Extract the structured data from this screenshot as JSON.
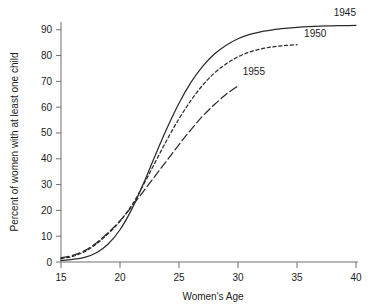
{
  "chart_data": {
    "type": "line",
    "title": "",
    "xlabel": "Women's Age",
    "ylabel": "Percent of women with at least one child",
    "xlim": [
      15,
      40
    ],
    "ylim": [
      0,
      93
    ],
    "grid": false,
    "legend_position": "inline-end-of-line",
    "xticks": [
      15,
      20,
      25,
      30,
      35,
      40
    ],
    "xtick_labels": [
      "15",
      "20",
      "25",
      "30",
      "35",
      "40"
    ],
    "yticks": [
      0,
      10,
      20,
      30,
      40,
      50,
      60,
      70,
      80,
      90
    ],
    "ytick_labels": [
      "0",
      "10",
      "20",
      "30",
      "40",
      "50",
      "60",
      "70",
      "80",
      "90"
    ],
    "series": [
      {
        "name": "1945",
        "label": "1945",
        "style": "solid",
        "color": "#2b2b2b",
        "x": [
          15,
          16,
          17,
          18,
          19,
          20,
          21,
          22,
          23,
          24,
          25,
          26,
          27,
          28,
          29,
          30,
          31,
          32,
          33,
          34,
          35,
          36,
          37,
          38,
          39,
          40
        ],
        "y": [
          0.6,
          1.0,
          1.8,
          3.6,
          7.0,
          12.5,
          20.5,
          30.5,
          41.5,
          52.0,
          61.5,
          69.5,
          75.8,
          80.6,
          84.0,
          86.5,
          88.2,
          89.3,
          90.0,
          90.5,
          90.9,
          91.2,
          91.4,
          91.5,
          91.6,
          91.7
        ]
      },
      {
        "name": "1950",
        "label": "1950",
        "style": "dashed",
        "color": "#2b2b2b",
        "x": [
          15,
          16,
          17,
          18,
          19,
          20,
          21,
          22,
          23,
          24,
          25,
          26,
          27,
          28,
          29,
          30,
          31,
          32,
          33,
          34,
          35
        ],
        "y": [
          1.3,
          2.2,
          4.0,
          7.0,
          11.0,
          15.8,
          22.0,
          30.0,
          38.8,
          47.5,
          55.5,
          62.5,
          68.5,
          73.2,
          76.8,
          79.5,
          81.4,
          82.6,
          83.4,
          83.9,
          84.2
        ]
      },
      {
        "name": "1955",
        "label": "1955",
        "style": "long-dashed",
        "color": "#2b2b2b",
        "x": [
          15,
          16,
          17,
          18,
          19,
          20,
          21,
          22,
          23,
          24,
          25,
          26,
          27,
          28,
          29,
          30
        ],
        "y": [
          1.6,
          2.6,
          4.4,
          7.4,
          11.4,
          16.0,
          21.5,
          27.5,
          33.5,
          39.5,
          45.5,
          51.2,
          56.5,
          61.0,
          65.0,
          68.2
        ]
      }
    ],
    "annotations": [
      {
        "text": "1945",
        "x": 40.0,
        "y": 95.5,
        "anchor": "end"
      },
      {
        "text": "1950",
        "x": 35.6,
        "y": 87.0,
        "anchor": "start"
      },
      {
        "text": "1955",
        "x": 30.4,
        "y": 72.5,
        "anchor": "start"
      }
    ]
  }
}
